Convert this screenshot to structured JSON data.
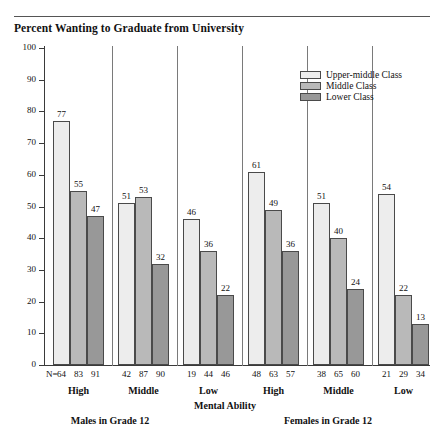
{
  "chart_data": {
    "type": "bar",
    "title": "Percent Wanting to Graduate from University",
    "xlabel": "Mental Ability",
    "ylabel": "",
    "ylim": [
      0,
      100
    ],
    "ytick_labels": [
      "0",
      "10",
      "20",
      "30",
      "40",
      "50",
      "60",
      "70",
      "80",
      "90",
      "100"
    ],
    "ytick_values": [
      0,
      10,
      20,
      30,
      40,
      50,
      60,
      70,
      80,
      90,
      100
    ],
    "grid": false,
    "legend_position": "top-right",
    "legend": [
      "Upper-middle Class",
      "Middle Class",
      "Lower Class"
    ],
    "categories": [
      "High",
      "Middle",
      "Low",
      "High",
      "Middle",
      "Low"
    ],
    "panels": [
      "Males in Grade 12",
      "Females in Grade 12"
    ],
    "series": [
      {
        "name": "Upper-middle Class",
        "values": [
          77,
          51,
          46,
          61,
          51,
          54
        ]
      },
      {
        "name": "Middle Class",
        "values": [
          55,
          53,
          36,
          49,
          40,
          22
        ]
      },
      {
        "name": "Lower Class",
        "values": [
          47,
          32,
          22,
          36,
          24,
          13
        ]
      }
    ],
    "n_prefix": "N=",
    "n_counts": [
      [
        64,
        83,
        91
      ],
      [
        42,
        87,
        90
      ],
      [
        19,
        44,
        46
      ],
      [
        48,
        63,
        57
      ],
      [
        38,
        65,
        60
      ],
      [
        21,
        29,
        34
      ]
    ],
    "colors": {
      "upper_middle": "#ededed",
      "middle": "#b9b9b9",
      "lower": "#989898",
      "outline": "#4a4a4a",
      "axis": "#3a3a3a",
      "text": "#111111",
      "background": "#ffffff"
    }
  }
}
